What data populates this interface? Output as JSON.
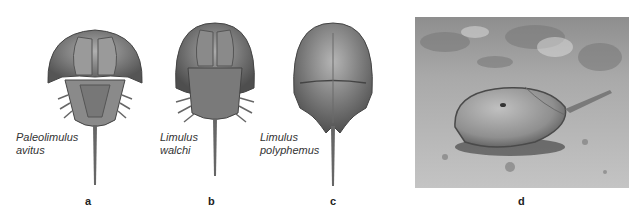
{
  "figure": {
    "panels": [
      {
        "letter": "a",
        "species_line1": "Paleolimulus",
        "species_line2": "avitus",
        "kind": "illustration"
      },
      {
        "letter": "b",
        "species_line1": "Limulus",
        "species_line2": "walchi",
        "kind": "illustration"
      },
      {
        "letter": "c",
        "species_line1": "Limulus",
        "species_line2": "polyphemus",
        "kind": "illustration"
      },
      {
        "letter": "d",
        "kind": "photograph",
        "subject": "horseshoe crab on sandy seabed"
      }
    ],
    "colors": {
      "shell_dark": "#4a4a4a",
      "shell_mid": "#8a8a8a",
      "shell_light": "#c8c8c8",
      "sand": "#b5b5b5"
    }
  }
}
